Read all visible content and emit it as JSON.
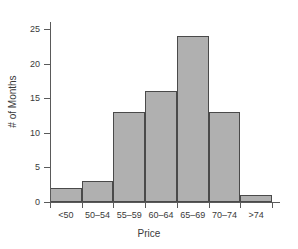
{
  "chart_data": {
    "type": "bar",
    "title": "",
    "subtitle": "",
    "xlabel": "Price",
    "ylabel": "# of Months",
    "categories": [
      "<50",
      "50–54",
      "55–59",
      "60–64",
      "65–69",
      "70–74",
      ">74"
    ],
    "values": [
      2,
      3,
      13,
      16,
      24,
      13,
      1
    ],
    "series": [
      {
        "name": "# of Months",
        "values": [
          2,
          3,
          13,
          16,
          24,
          13,
          1
        ]
      }
    ],
    "ylim": [
      0,
      26
    ],
    "xlim": [
      0,
      7
    ],
    "y_ticks": [
      0,
      5,
      10,
      15,
      20,
      25
    ],
    "y_tick_labels": [
      "0",
      "5",
      "10",
      "15",
      "20",
      "25"
    ],
    "x_tick_labels": [
      "<50",
      "50–54",
      "55–59",
      "60–64",
      "65–69",
      "70–74",
      ">74"
    ],
    "grid": false,
    "legend": false,
    "legend_position": "none",
    "bar_fill_color": "#b0b0b0",
    "bar_edge_color": "#4a4a4a",
    "axis_color": "#5a5a5a",
    "background_color": "#ffffff",
    "annotations": []
  }
}
